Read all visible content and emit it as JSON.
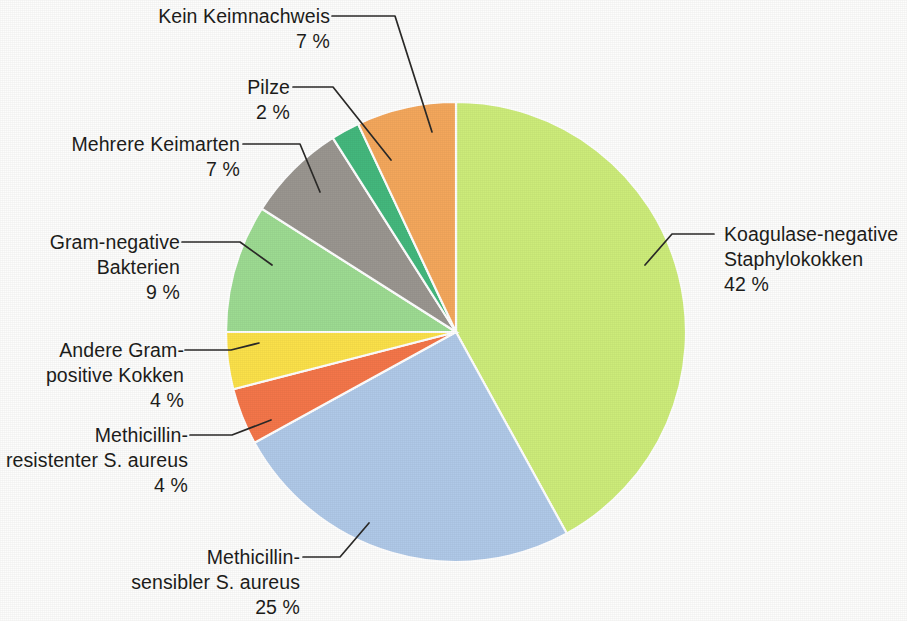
{
  "chart_data": {
    "type": "pie",
    "title": "",
    "subtitle": "",
    "xlabel": "",
    "ylabel": "",
    "legend_position": "callout-labels",
    "grid": false,
    "units": "%",
    "start_angle_deg": 0,
    "direction": "clockwise",
    "categories": [
      "Koagulase-negative Staphylokokken",
      "Methicillin-sensibler S. aureus",
      "Methicillin-resistenter S. aureus",
      "Andere Gram-positive Kokken",
      "Gram-negative Bakterien",
      "Mehrere Keimarten",
      "Pilze",
      "Kein Keimnachweis"
    ],
    "values": [
      42,
      25,
      4,
      4,
      9,
      7,
      2,
      7
    ],
    "colors": [
      "#cdec7a",
      "#b0c9e8",
      "#f4764a",
      "#fbe14a",
      "#9ddb92",
      "#9a9690",
      "#44b87d",
      "#f4a75c"
    ],
    "slices": [
      {
        "label_line1": "Koagulase-negative",
        "label_line2": "Staphylokokken",
        "value": 42,
        "pct_text": "42 %",
        "color": "#cdec7a"
      },
      {
        "label_line1": "Methicillin-",
        "label_line2": "sensibler S. aureus",
        "value": 25,
        "pct_text": "25 %",
        "color": "#b0c9e8"
      },
      {
        "label_line1": "Methicillin-",
        "label_line2": "resistenter S. aureus",
        "value": 4,
        "pct_text": "4 %",
        "color": "#f4764a"
      },
      {
        "label_line1": "Andere Gram-",
        "label_line2": "positive Kokken",
        "value": 4,
        "pct_text": "4 %",
        "color": "#fbe14a"
      },
      {
        "label_line1": "Gram-negative",
        "label_line2": "Bakterien",
        "value": 9,
        "pct_text": "9 %",
        "color": "#9ddb92"
      },
      {
        "label_line1": "Mehrere Keimarten",
        "label_line2": "",
        "value": 7,
        "pct_text": "7 %",
        "color": "#9a9690"
      },
      {
        "label_line1": "Pilze",
        "label_line2": "",
        "value": 2,
        "pct_text": "2 %",
        "color": "#44b87d"
      },
      {
        "label_line1": "Kein Keimnachweis",
        "label_line2": "",
        "value": 7,
        "pct_text": "7 %",
        "color": "#f4a75c"
      }
    ]
  },
  "labels": {
    "kein_keimnachweis": {
      "line1": "Kein Keimnachweis",
      "pct": "7 %"
    },
    "pilze": {
      "line1": "Pilze",
      "pct": "2 %"
    },
    "mehrere_keimarten": {
      "line1": "Mehrere Keimarten",
      "pct": "7 %"
    },
    "gram_negative": {
      "line1": "Gram-negative",
      "line2": "Bakterien",
      "pct": "9 %"
    },
    "andere_gram_positive": {
      "line1": "Andere Gram-",
      "line2": "positive Kokken",
      "pct": "4 %"
    },
    "mrsa": {
      "line1": "Methicillin-",
      "line2": "resistenter S. aureus",
      "pct": "4 %"
    },
    "mssa": {
      "line1": "Methicillin-",
      "line2": "sensibler S. aureus",
      "pct": "25 %"
    },
    "kns": {
      "line1": "Koagulase-negative",
      "line2": "Staphylokokken",
      "pct": "42 %"
    }
  }
}
